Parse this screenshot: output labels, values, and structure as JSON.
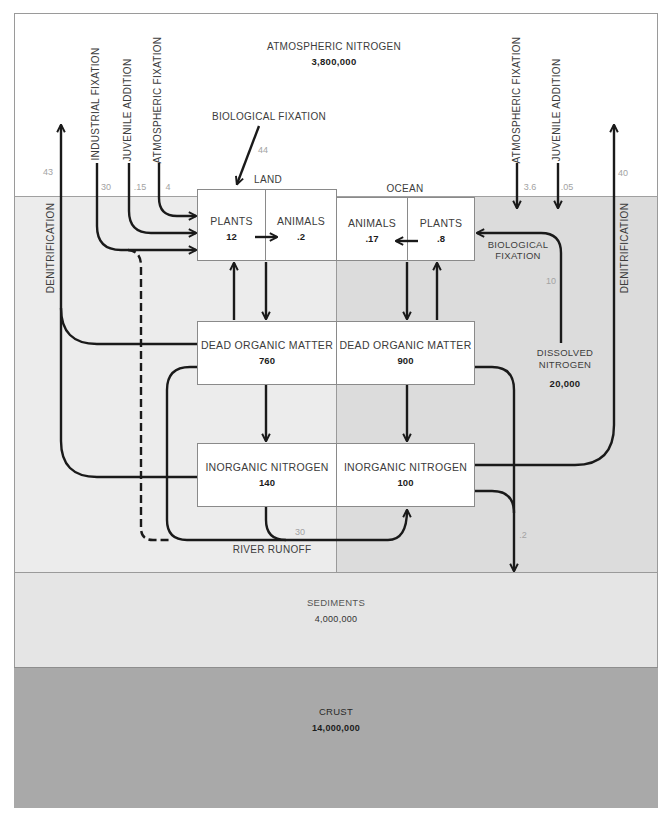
{
  "atmosphere": {
    "label": "ATMOSPHERIC NITROGEN",
    "value": "3,800,000"
  },
  "land": {
    "label": "LAND",
    "plants": {
      "label": "PLANTS",
      "value": "12"
    },
    "animals": {
      "label": "ANIMALS",
      "value": ".2"
    },
    "dead_organic_matter": {
      "label": "DEAD ORGANIC MATTER",
      "value": "760"
    },
    "inorganic_nitrogen": {
      "label": "INORGANIC NITROGEN",
      "value": "140"
    }
  },
  "ocean": {
    "label": "OCEAN",
    "animals": {
      "label": "ANIMALS",
      "value": ".17"
    },
    "plants": {
      "label": "PLANTS",
      "value": ".8"
    },
    "dead_organic_matter": {
      "label": "DEAD ORGANIC MATTER",
      "value": "900"
    },
    "inorganic_nitrogen": {
      "label": "INORGANIC NITROGEN",
      "value": "100"
    },
    "dissolved_nitrogen": {
      "label_line1": "DISSOLVED",
      "label_line2": "NITROGEN",
      "value": "20,000"
    }
  },
  "sediments": {
    "label": "SEDIMENTS",
    "value": "4,000,000"
  },
  "crust": {
    "label": "CRUST",
    "value": "14,000,000"
  },
  "flows": {
    "land_denitrification": {
      "label": "DENITRIFICATION",
      "value": "43"
    },
    "land_industrial_fixation": {
      "label": "INDUSTRIAL FIXATION",
      "value": "30"
    },
    "land_juvenile_addition": {
      "label": "JUVENILE ADDITION",
      "value": ".15"
    },
    "land_atmospheric_fixation": {
      "label": "ATMOSPHERIC FIXATION",
      "value": "4"
    },
    "land_biological_fixation": {
      "label": "BIOLOGICAL FIXATION",
      "value": "44"
    },
    "ocean_atmospheric_fixation": {
      "label": "ATMOSPHERIC FIXATION",
      "value": "3.6"
    },
    "ocean_juvenile_addition": {
      "label": "JUVENILE ADDITION",
      "value": ".05"
    },
    "ocean_denitrification": {
      "label": "DENITRIFICATION",
      "value": "40"
    },
    "ocean_biological_fixation": {
      "label_line1": "BIOLOGICAL",
      "label_line2": "FIXATION",
      "value": "10"
    },
    "river_runoff": {
      "label": "RIVER RUNOFF",
      "value": "30"
    },
    "sedimentation": {
      "value": ".2"
    }
  },
  "colors": {
    "atmosphere": "#ffffff",
    "land": "#ececec",
    "ocean": "#dcdcdc",
    "sediments": "#e5e5e5",
    "crust": "#a9a9a9",
    "arrows": "#1a1a1a",
    "flow_values": "#a3a3a3"
  }
}
